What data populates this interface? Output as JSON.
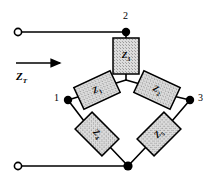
{
  "figure": {
    "background_color": "#ffffff",
    "line_color": "#000000",
    "component_fill": "#d9d9d9",
    "component_border": "#000000"
  },
  "source_label": {
    "name": "total-impedance",
    "symbol": "Z",
    "subscript": "T",
    "arrow_direction": "right"
  },
  "terminals": [
    {
      "name": "top-left-terminal",
      "type": "open-circle",
      "x": 18,
      "y": 32
    },
    {
      "name": "bottom-left-terminal",
      "type": "open-circle",
      "x": 18,
      "y": 166
    }
  ],
  "nodes": [
    {
      "name": "node-1",
      "label": "1",
      "type": "filled-dot",
      "x": 68,
      "y": 100
    },
    {
      "name": "node-2",
      "label": "2",
      "type": "filled-dot",
      "x": 126,
      "y": 32
    },
    {
      "name": "node-3",
      "label": "3",
      "type": "filled-dot",
      "x": 190,
      "y": 100
    },
    {
      "name": "node-center",
      "label": "",
      "type": "junction",
      "x": 126,
      "y": 78
    },
    {
      "name": "node-bottom",
      "label": "",
      "type": "filled-dot",
      "x": 128,
      "y": 166
    }
  ],
  "components": [
    {
      "name": "impedance-z3",
      "symbol": "Z",
      "subscript": "3",
      "label": "Z3",
      "shape": "rectangle",
      "orientation": "vertical",
      "cx": 126,
      "cy": 56,
      "w": 26,
      "h": 36,
      "rotation": 0
    },
    {
      "name": "impedance-z1",
      "symbol": "Z",
      "subscript": "1",
      "label": "Z1",
      "shape": "rectangle",
      "orientation": "tilted",
      "cx": 97,
      "cy": 90,
      "w": 40,
      "h": 24,
      "rotation": -25
    },
    {
      "name": "impedance-z2",
      "symbol": "Z",
      "subscript": "2",
      "label": "Z2",
      "shape": "rectangle",
      "orientation": "tilted",
      "cx": 157,
      "cy": 90,
      "w": 40,
      "h": 24,
      "rotation": 25
    },
    {
      "name": "impedance-z4",
      "symbol": "Z",
      "subscript": "4",
      "label": "Z4",
      "shape": "rectangle",
      "orientation": "diamond",
      "cx": 97,
      "cy": 134,
      "w": 38,
      "h": 24,
      "rotation": 45
    },
    {
      "name": "impedance-z5",
      "symbol": "Z",
      "subscript": "5",
      "label": "Z5",
      "shape": "rectangle",
      "orientation": "diamond",
      "cx": 159,
      "cy": 134,
      "w": 38,
      "h": 24,
      "rotation": -45
    }
  ],
  "wires": [
    {
      "name": "wire-top-lead",
      "from": "top-left-terminal",
      "to": "node-2"
    },
    {
      "name": "wire-bottom-lead",
      "from": "bottom-left-terminal",
      "to": "node-bottom"
    },
    {
      "name": "wire-node2-to-z3",
      "from": "node-2",
      "to": "impedance-z3"
    },
    {
      "name": "wire-z3-to-center",
      "from": "impedance-z3",
      "to": "node-center"
    },
    {
      "name": "wire-center-to-z1",
      "from": "node-center",
      "to": "impedance-z1"
    },
    {
      "name": "wire-z1-to-node1",
      "from": "impedance-z1",
      "to": "node-1"
    },
    {
      "name": "wire-center-to-z2",
      "from": "node-center",
      "to": "impedance-z2"
    },
    {
      "name": "wire-z2-to-node3",
      "from": "impedance-z2",
      "to": "node-3"
    },
    {
      "name": "wire-node1-to-z4",
      "from": "node-1",
      "to": "impedance-z4"
    },
    {
      "name": "wire-z4-to-bottom",
      "from": "impedance-z4",
      "to": "node-bottom"
    },
    {
      "name": "wire-node3-to-z5",
      "from": "node-3",
      "to": "impedance-z5"
    },
    {
      "name": "wire-z5-to-bottom",
      "from": "impedance-z5",
      "to": "node-bottom"
    }
  ]
}
